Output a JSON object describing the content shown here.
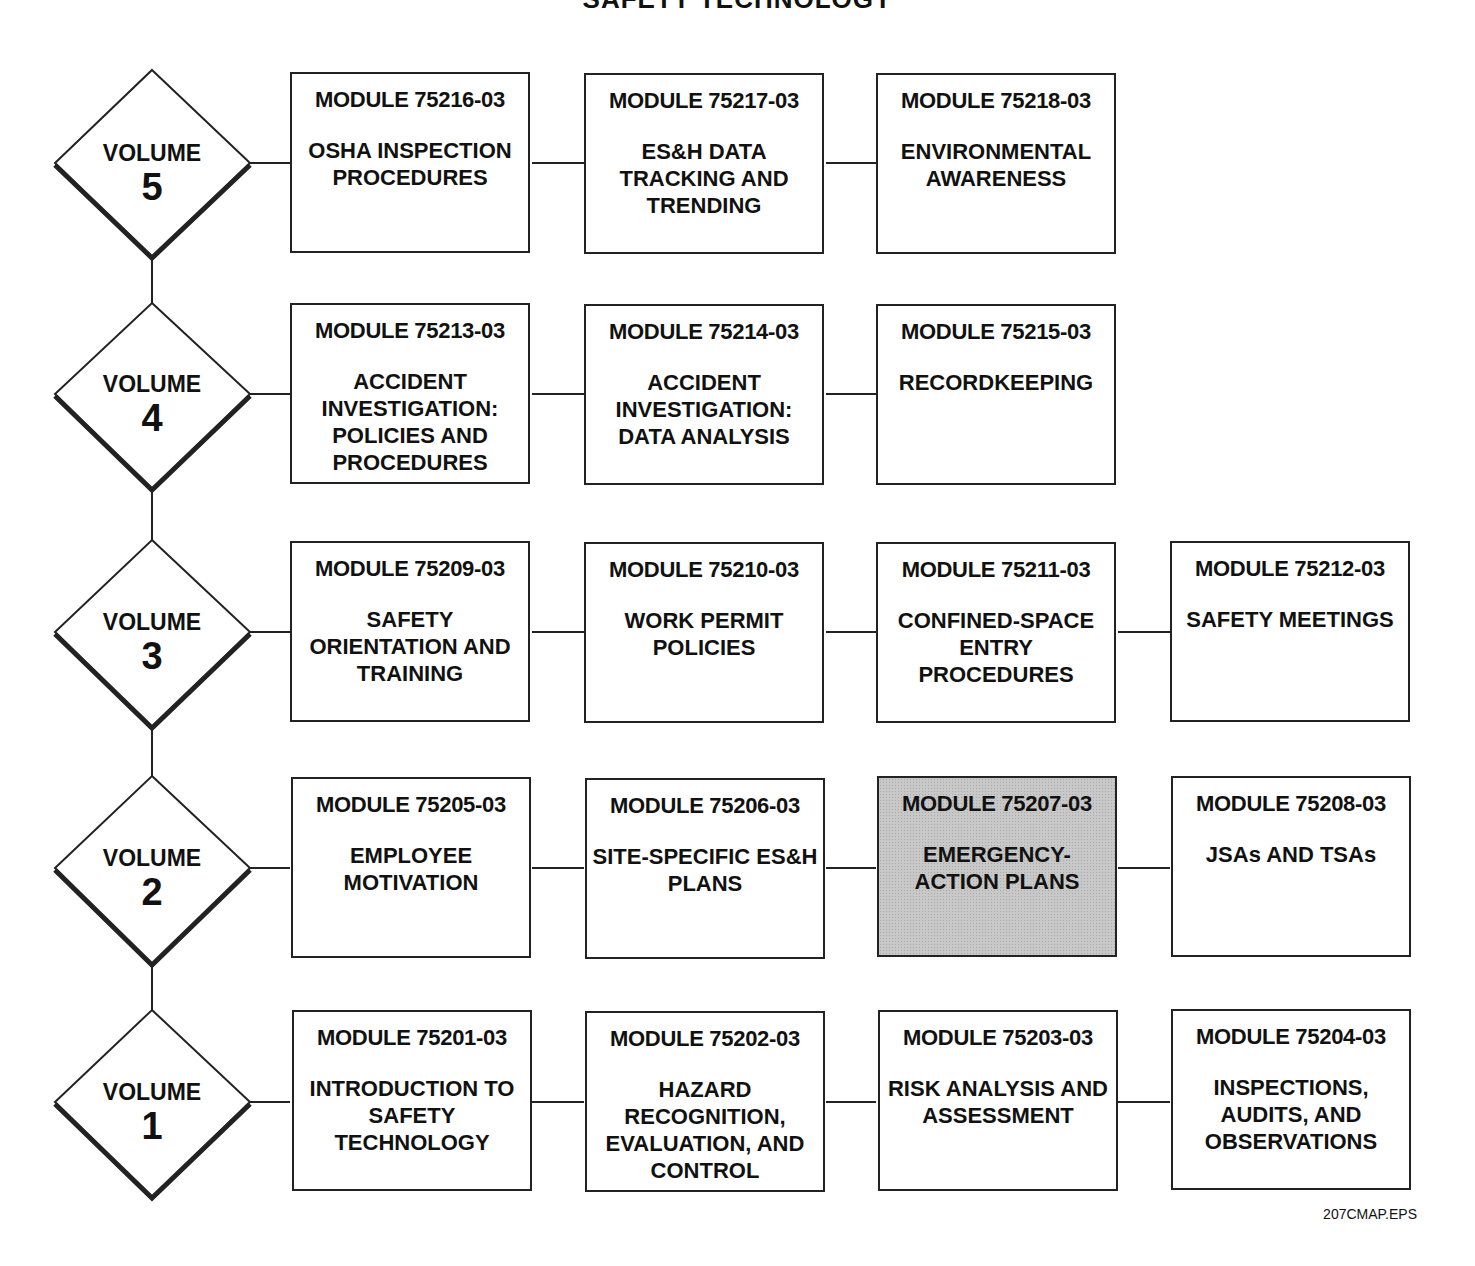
{
  "title": "SAFETY TECHNOLOGY",
  "footer": "207CMAP.EPS",
  "highlight_color": "#c8c8c8",
  "volumes": [
    {
      "label": "VOLUME",
      "number": "5",
      "modules": [
        {
          "code": "MODULE 75216-03",
          "name": "OSHA INSPECTION PROCEDURES"
        },
        {
          "code": "MODULE 75217-03",
          "name": "ES&H DATA TRACKING AND TRENDING"
        },
        {
          "code": "MODULE 75218-03",
          "name": "ENVIRONMENTAL AWARENESS"
        }
      ]
    },
    {
      "label": "VOLUME",
      "number": "4",
      "modules": [
        {
          "code": "MODULE 75213-03",
          "name": "ACCIDENT INVESTIGATION: POLICIES AND PROCEDURES"
        },
        {
          "code": "MODULE 75214-03",
          "name": "ACCIDENT INVESTIGATION: DATA ANALYSIS"
        },
        {
          "code": "MODULE 75215-03",
          "name": "RECORDKEEPING"
        }
      ]
    },
    {
      "label": "VOLUME",
      "number": "3",
      "modules": [
        {
          "code": "MODULE 75209-03",
          "name": "SAFETY ORIENTATION AND TRAINING"
        },
        {
          "code": "MODULE 75210-03",
          "name": "WORK PERMIT POLICIES"
        },
        {
          "code": "MODULE 75211-03",
          "name": "CONFINED-SPACE ENTRY PROCEDURES"
        },
        {
          "code": "MODULE 75212-03",
          "name": "SAFETY MEETINGS"
        }
      ]
    },
    {
      "label": "VOLUME",
      "number": "2",
      "modules": [
        {
          "code": "MODULE 75205-03",
          "name": "EMPLOYEE MOTIVATION"
        },
        {
          "code": "MODULE 75206-03",
          "name": "SITE-SPECIFIC ES&H PLANS"
        },
        {
          "code": "MODULE 75207-03",
          "name": "EMERGENCY-ACTION PLANS",
          "highlighted": true
        },
        {
          "code": "MODULE 75208-03",
          "name": "JSAs AND TSAs"
        }
      ]
    },
    {
      "label": "VOLUME",
      "number": "1",
      "modules": [
        {
          "code": "MODULE 75201-03",
          "name": "INTRODUCTION TO SAFETY TECHNOLOGY"
        },
        {
          "code": "MODULE 75202-03",
          "name": "HAZARD RECOGNITION, EVALUATION, AND CONTROL"
        },
        {
          "code": "MODULE 75203-03",
          "name": "RISK ANALYSIS AND ASSESSMENT"
        },
        {
          "code": "MODULE 75204-03",
          "name": "INSPECTIONS, AUDITS, AND OBSERVATIONS"
        }
      ]
    }
  ]
}
